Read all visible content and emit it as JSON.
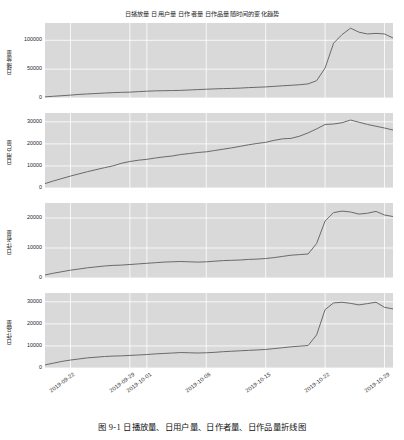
{
  "figure": {
    "title": "日播放量 日用户量 日作者量 日作品量随时间的变化趋势",
    "caption": "图 9-1  日播放量、日用户量、日作者量、日作品量折线图",
    "background_color": "#ffffff",
    "plot_background_color": "#d9d9d9",
    "grid_color": "#ffffff",
    "line_color": "#6a6a6a"
  },
  "chart_data": [
    {
      "type": "line",
      "title": "日播放量 日用户量 日作者量 日作品量随时间的变化趋势",
      "panel_index": 0,
      "xlabel": "",
      "ylabel": "日播放量",
      "ylim": [
        0,
        130000
      ],
      "yticks": [
        0,
        50000,
        100000
      ],
      "ytick_labels": [
        "0",
        "50000",
        "100000"
      ],
      "grid": true,
      "legend": "none",
      "x": [
        "2019-09-19",
        "2019-09-20",
        "2019-09-21",
        "2019-09-22",
        "2019-09-23",
        "2019-09-24",
        "2019-09-25",
        "2019-09-26",
        "2019-09-27",
        "2019-09-28",
        "2019-09-29",
        "2019-09-30",
        "2019-10-01",
        "2019-10-02",
        "2019-10-03",
        "2019-10-04",
        "2019-10-05",
        "2019-10-06",
        "2019-10-07",
        "2019-10-08",
        "2019-10-09",
        "2019-10-10",
        "2019-10-11",
        "2019-10-12",
        "2019-10-13",
        "2019-10-14",
        "2019-10-15",
        "2019-10-16",
        "2019-10-17",
        "2019-10-18",
        "2019-10-19",
        "2019-10-20",
        "2019-10-21",
        "2019-10-22",
        "2019-10-23",
        "2019-10-24",
        "2019-10-25",
        "2019-10-26",
        "2019-10-27",
        "2019-10-28",
        "2019-10-29",
        "2019-10-30"
      ],
      "values": [
        2000,
        3000,
        4000,
        5000,
        6200,
        7000,
        7800,
        8600,
        9300,
        9800,
        10200,
        11000,
        11800,
        12400,
        12600,
        12900,
        13200,
        13900,
        14600,
        15200,
        15800,
        16300,
        16600,
        17200,
        18000,
        18600,
        19200,
        20200,
        21200,
        22000,
        23000,
        24500,
        30000,
        52000,
        95000,
        110000,
        121000,
        114000,
        111000,
        112000,
        111000,
        104000
      ]
    },
    {
      "type": "line",
      "panel_index": 1,
      "xlabel": "",
      "ylabel": "日用户量",
      "ylim": [
        0,
        34000
      ],
      "yticks": [
        0,
        10000,
        20000,
        30000
      ],
      "ytick_labels": [
        "0",
        "10000",
        "20000",
        "30000"
      ],
      "grid": true,
      "legend": "none",
      "x": [
        "2019-09-19",
        "2019-09-20",
        "2019-09-21",
        "2019-09-22",
        "2019-09-23",
        "2019-09-24",
        "2019-09-25",
        "2019-09-26",
        "2019-09-27",
        "2019-09-28",
        "2019-09-29",
        "2019-09-30",
        "2019-10-01",
        "2019-10-02",
        "2019-10-03",
        "2019-10-04",
        "2019-10-05",
        "2019-10-06",
        "2019-10-07",
        "2019-10-08",
        "2019-10-09",
        "2019-10-10",
        "2019-10-11",
        "2019-10-12",
        "2019-10-13",
        "2019-10-14",
        "2019-10-15",
        "2019-10-16",
        "2019-10-17",
        "2019-10-18",
        "2019-10-19",
        "2019-10-20",
        "2019-10-21",
        "2019-10-22",
        "2019-10-23",
        "2019-10-24",
        "2019-10-25",
        "2019-10-26",
        "2019-10-27",
        "2019-10-28",
        "2019-10-29",
        "2019-10-30"
      ],
      "values": [
        2000,
        3200,
        4300,
        5400,
        6400,
        7400,
        8300,
        9200,
        10000,
        11200,
        12000,
        12600,
        13000,
        13600,
        14100,
        14500,
        15200,
        15600,
        16100,
        16400,
        17000,
        17600,
        18200,
        18900,
        19600,
        20200,
        20700,
        21600,
        22300,
        22500,
        23500,
        25000,
        26800,
        28800,
        29000,
        29600,
        30800,
        29800,
        28800,
        28000,
        27200,
        26300
      ]
    },
    {
      "type": "line",
      "panel_index": 2,
      "xlabel": "",
      "ylabel": "日作者量",
      "ylim": [
        0,
        25000
      ],
      "yticks": [
        0,
        10000,
        20000
      ],
      "ytick_labels": [
        "0",
        "10000",
        "20000"
      ],
      "grid": true,
      "legend": "none",
      "x": [
        "2019-09-19",
        "2019-09-20",
        "2019-09-21",
        "2019-09-22",
        "2019-09-23",
        "2019-09-24",
        "2019-09-25",
        "2019-09-26",
        "2019-09-27",
        "2019-09-28",
        "2019-09-29",
        "2019-09-30",
        "2019-10-01",
        "2019-10-02",
        "2019-10-03",
        "2019-10-04",
        "2019-10-05",
        "2019-10-06",
        "2019-10-07",
        "2019-10-08",
        "2019-10-09",
        "2019-10-10",
        "2019-10-11",
        "2019-10-12",
        "2019-10-13",
        "2019-10-14",
        "2019-10-15",
        "2019-10-16",
        "2019-10-17",
        "2019-10-18",
        "2019-10-19",
        "2019-10-20",
        "2019-10-21",
        "2019-10-22",
        "2019-10-23",
        "2019-10-24",
        "2019-10-25",
        "2019-10-26",
        "2019-10-27",
        "2019-10-28",
        "2019-10-29",
        "2019-10-30"
      ],
      "values": [
        1000,
        1600,
        2100,
        2600,
        3000,
        3400,
        3700,
        4000,
        4200,
        4300,
        4500,
        4700,
        4900,
        5100,
        5300,
        5400,
        5500,
        5400,
        5300,
        5400,
        5600,
        5800,
        5900,
        6000,
        6200,
        6300,
        6500,
        6800,
        7200,
        7600,
        7800,
        8000,
        11500,
        19000,
        21800,
        22300,
        22000,
        21300,
        21600,
        22200,
        21000,
        20500
      ]
    },
    {
      "type": "line",
      "panel_index": 3,
      "xlabel": "",
      "ylabel": "日作品量",
      "ylim": [
        0,
        34000
      ],
      "yticks": [
        0,
        10000,
        20000,
        30000
      ],
      "ytick_labels": [
        "0",
        "10000",
        "20000",
        "30000"
      ],
      "grid": true,
      "legend": "none",
      "x": [
        "2019-09-19",
        "2019-09-20",
        "2019-09-21",
        "2019-09-22",
        "2019-09-23",
        "2019-09-24",
        "2019-09-25",
        "2019-09-26",
        "2019-09-27",
        "2019-09-28",
        "2019-09-29",
        "2019-09-30",
        "2019-10-01",
        "2019-10-02",
        "2019-10-03",
        "2019-10-04",
        "2019-10-05",
        "2019-10-06",
        "2019-10-07",
        "2019-10-08",
        "2019-10-09",
        "2019-10-10",
        "2019-10-11",
        "2019-10-12",
        "2019-10-13",
        "2019-10-14",
        "2019-10-15",
        "2019-10-16",
        "2019-10-17",
        "2019-10-18",
        "2019-10-19",
        "2019-10-20",
        "2019-10-21",
        "2019-10-22",
        "2019-10-23",
        "2019-10-24",
        "2019-10-25",
        "2019-10-26",
        "2019-10-27",
        "2019-10-28",
        "2019-10-29",
        "2019-10-30"
      ],
      "values": [
        1400,
        2200,
        3000,
        3600,
        4100,
        4600,
        4900,
        5200,
        5400,
        5500,
        5700,
        5900,
        6100,
        6400,
        6600,
        6800,
        7000,
        6900,
        6800,
        6900,
        7100,
        7400,
        7600,
        7800,
        8000,
        8200,
        8400,
        8800,
        9200,
        9600,
        9900,
        10200,
        15000,
        26500,
        29500,
        29800,
        29300,
        28600,
        29200,
        29800,
        27500,
        26800
      ]
    }
  ],
  "axis": {
    "xtick_labels": [
      "2019-09-22",
      "2019-09-29",
      "2019-10-01",
      "2019-10-08",
      "2019-10-15",
      "2019-10-22",
      "2019-10-29"
    ],
    "xtick_positions": [
      3,
      10,
      12,
      19,
      26,
      33,
      40
    ]
  }
}
